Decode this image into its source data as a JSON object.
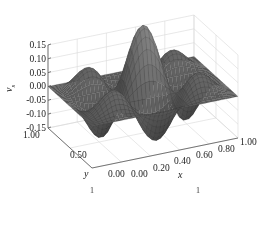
{
  "chart_data": {
    "type": "surface3d",
    "title": "",
    "xlabel": "x",
    "ylabel": "y",
    "zlabel": "v_s",
    "xlim": [
      0,
      1
    ],
    "ylim": [
      0,
      1
    ],
    "zlim": [
      -0.15,
      0.15
    ],
    "x_ticks": [
      "0.00",
      "0.20",
      "0.40",
      "0.60",
      "0.80",
      "1.00"
    ],
    "y_ticks": [
      "0.00",
      "0.50",
      "1.00"
    ],
    "z_ticks": [
      "0.15",
      "0.10",
      "0.05",
      "0.00",
      "-0.05",
      "-0.10",
      "-0.15"
    ],
    "surface_function": "z = 0.15 * sin(2*pi*x*1.5) * sin(2*pi*y*1.5)",
    "amplitude": 0.15,
    "peaks_visible": 3,
    "grid": true,
    "surface_color": "#5a5a5a",
    "edge_color": "#3a3a3a"
  },
  "labels": {
    "z_axis_name": "v",
    "z_axis_sub": "s",
    "x_axis_name": "x",
    "y_axis_name": "y"
  },
  "caption_fragments": [
    "1",
    "1"
  ]
}
